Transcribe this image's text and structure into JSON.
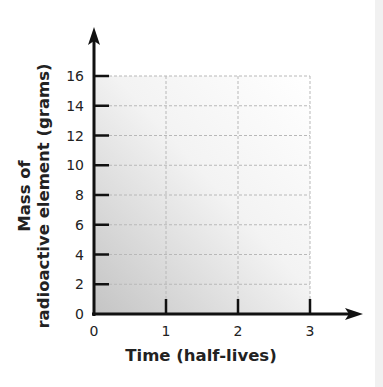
{
  "chart_data": {
    "type": "line",
    "title": "",
    "xlabel": "Time (half-lives)",
    "ylabel_lines": [
      "Mass of",
      "radioactive element (grams)"
    ],
    "ylabel": "Mass of radioactive element (grams)",
    "x_ticks": [
      "0",
      "1",
      "2",
      "3"
    ],
    "y_ticks": [
      "0",
      "2",
      "4",
      "6",
      "8",
      "10",
      "12",
      "14",
      "16"
    ],
    "xlim": [
      0,
      3
    ],
    "ylim": [
      0,
      16
    ],
    "grid": true,
    "grid_style": "dashed",
    "series": [],
    "legend": null,
    "note": "Blank graph grid with no plotted data"
  },
  "colors": {
    "axis": "#111111",
    "grid": "#b8b8b8",
    "gradient_dark": "#c9c9c9",
    "gradient_light": "#ffffff"
  }
}
